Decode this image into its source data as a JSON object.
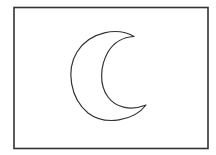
{
  "figure": {
    "colors": {
      "background": "#ffffff",
      "stroke": "#333333"
    }
  }
}
